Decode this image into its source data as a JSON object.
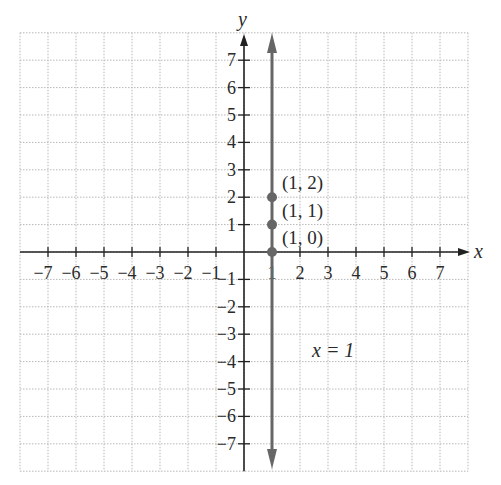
{
  "chart_data": {
    "type": "line",
    "title": "",
    "xlabel": "x",
    "ylabel": "y",
    "xlim": [
      -8,
      8
    ],
    "ylim": [
      -8,
      8
    ],
    "grid": true,
    "x_ticks": [
      -7,
      -6,
      -5,
      -4,
      -3,
      -2,
      -1,
      1,
      2,
      3,
      4,
      5,
      6,
      7
    ],
    "y_ticks": [
      -7,
      -6,
      -5,
      -4,
      -3,
      -2,
      -1,
      1,
      2,
      3,
      4,
      5,
      6,
      7
    ],
    "x_tick_labels": [
      "−7",
      "−6",
      "−5",
      "−4",
      "−3",
      "−2",
      "−1",
      "1",
      "2",
      "3",
      "4",
      "5",
      "6",
      "7"
    ],
    "y_tick_labels": [
      "−7",
      "−6",
      "−5",
      "−4",
      "−3",
      "−2",
      "−1",
      "1",
      "2",
      "3",
      "4",
      "5",
      "6",
      "7"
    ],
    "series": [
      {
        "name": "x = 1",
        "kind": "vertical-line",
        "x": 1,
        "y_range": [
          -8,
          8
        ],
        "arrows": "both",
        "color": "#666666"
      }
    ],
    "points": [
      {
        "x": 1,
        "y": 2,
        "label": "(1, 2)"
      },
      {
        "x": 1,
        "y": 1,
        "label": "(1, 1)"
      },
      {
        "x": 1,
        "y": 0,
        "label": "(1, 0)"
      }
    ],
    "annotations": [
      {
        "text": "x = 1",
        "x": 2.5,
        "y": -3.6
      }
    ]
  },
  "labels": {
    "x_axis": "x",
    "y_axis": "y",
    "equation": "x = 1"
  },
  "colors": {
    "axis": "#222222",
    "line": "#666666",
    "point": "#666666",
    "grid": "#b8b8b8",
    "text": "#2a2a2a"
  }
}
